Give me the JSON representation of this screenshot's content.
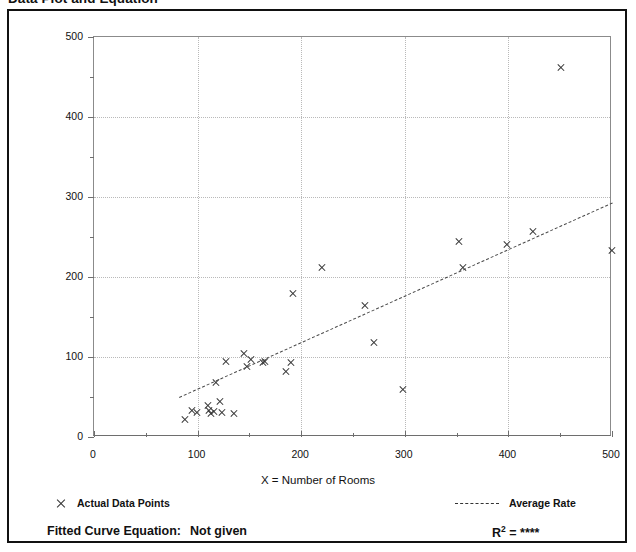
{
  "page": {
    "heading": "Data Plot and Equation"
  },
  "legend": {
    "data_points_label": "Actual Data Points",
    "average_rate_label": "Average Rate",
    "marker_icon": "x-cross-marker-icon",
    "line_icon": "dashed-line-icon"
  },
  "footer": {
    "equation_label": "Fitted Curve Equation:",
    "equation_value": "Not given",
    "r2_label": "R",
    "r2_exponent": "2",
    "r2_equals": " = ",
    "r2_value": "****"
  },
  "chart_data": {
    "type": "scatter",
    "title": "Data Plot and Equation",
    "xlabel": "X = Number of Rooms",
    "ylabel": "T = Average Vehicle Trip Ends",
    "xlim": [
      0,
      500
    ],
    "ylim": [
      0,
      500
    ],
    "xticks": [
      0,
      100,
      200,
      300,
      400,
      500
    ],
    "yticks": [
      0,
      100,
      200,
      300,
      400,
      500
    ],
    "xminor_step": 50,
    "yminor_step": 50,
    "grid": true,
    "legend_position": "below-axes",
    "series": [
      {
        "name": "Actual Data Points",
        "marker": "x",
        "points": [
          [
            88,
            22
          ],
          [
            95,
            33
          ],
          [
            99,
            31
          ],
          [
            110,
            40
          ],
          [
            111,
            33
          ],
          [
            113,
            30
          ],
          [
            116,
            32
          ],
          [
            118,
            68
          ],
          [
            122,
            45
          ],
          [
            124,
            31
          ],
          [
            127,
            95
          ],
          [
            135,
            29
          ],
          [
            145,
            105
          ],
          [
            148,
            88
          ],
          [
            152,
            97
          ],
          [
            163,
            93
          ],
          [
            165,
            95
          ],
          [
            185,
            82
          ],
          [
            190,
            93
          ],
          [
            192,
            179
          ],
          [
            220,
            212
          ],
          [
            262,
            164
          ],
          [
            270,
            118
          ],
          [
            298,
            60
          ],
          [
            352,
            244
          ],
          [
            356,
            212
          ],
          [
            399,
            241
          ],
          [
            424,
            257
          ],
          [
            451,
            462
          ],
          [
            500,
            233
          ]
        ]
      },
      {
        "name": "Average Rate",
        "type": "line",
        "style": "dashed",
        "endpoints": [
          [
            82,
            50
          ],
          [
            500,
            293
          ]
        ]
      }
    ]
  }
}
